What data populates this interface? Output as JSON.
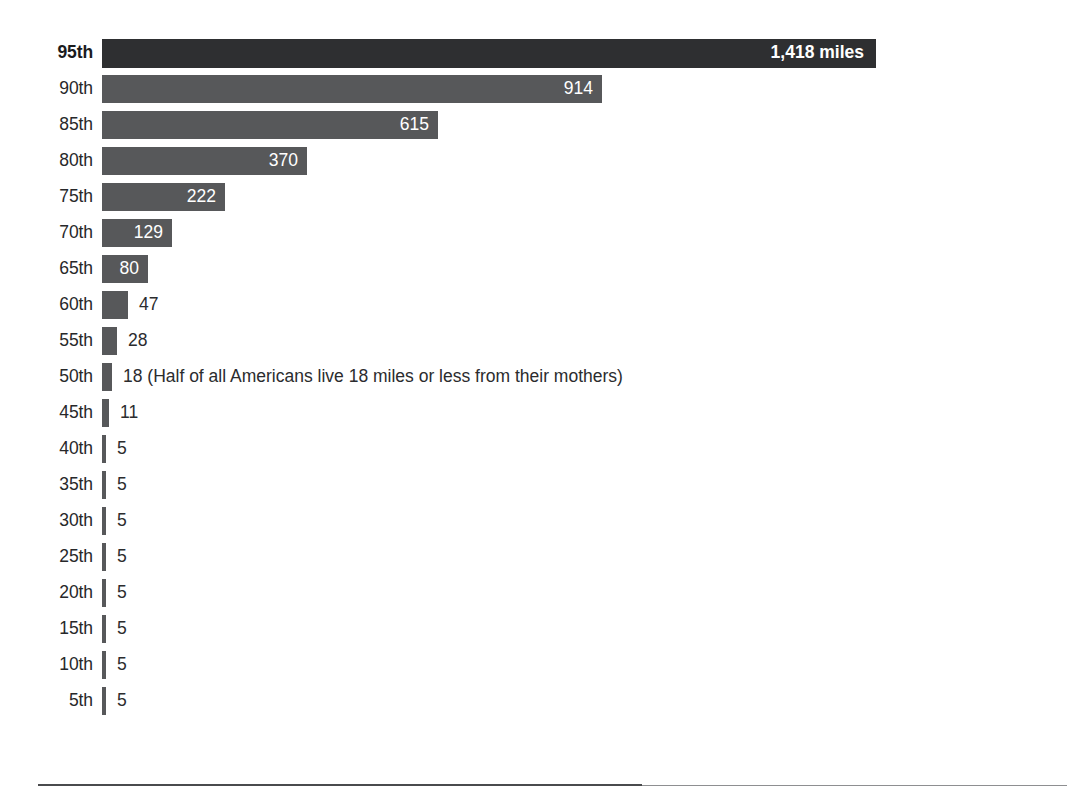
{
  "chart_data": {
    "type": "bar",
    "title": "",
    "subtitle": "",
    "xlabel": "",
    "ylabel": "",
    "orientation": "horizontal",
    "grid": false,
    "legend": null,
    "unit": "miles",
    "xlim": [
      0,
      1418
    ],
    "categories": [
      "95th",
      "90th",
      "85th",
      "80th",
      "75th",
      "70th",
      "65th",
      "60th",
      "55th",
      "50th",
      "45th",
      "40th",
      "35th",
      "30th",
      "25th",
      "20th",
      "15th",
      "10th",
      "5th"
    ],
    "values": [
      1418,
      914,
      615,
      370,
      222,
      129,
      80,
      47,
      28,
      18,
      11,
      5,
      5,
      5,
      5,
      5,
      5,
      5,
      5
    ],
    "annotations": [
      {
        "category": "50th",
        "text": "(Half of all Americans live 18 miles or less from their mothers)"
      }
    ],
    "bars": [
      {
        "label": "95th",
        "value": 1418,
        "value_text": "1,418 miles",
        "bar_px": 774,
        "label_inside": true,
        "highlight": true
      },
      {
        "label": "90th",
        "value": 914,
        "value_text": "914",
        "bar_px": 500,
        "label_inside": true,
        "highlight": false
      },
      {
        "label": "85th",
        "value": 615,
        "value_text": "615",
        "bar_px": 336,
        "label_inside": true,
        "highlight": false
      },
      {
        "label": "80th",
        "value": 370,
        "value_text": "370",
        "bar_px": 205,
        "label_inside": true,
        "highlight": false
      },
      {
        "label": "75th",
        "value": 222,
        "value_text": "222",
        "bar_px": 123,
        "label_inside": true,
        "highlight": false
      },
      {
        "label": "70th",
        "value": 129,
        "value_text": "129",
        "bar_px": 70,
        "label_inside": true,
        "highlight": false
      },
      {
        "label": "65th",
        "value": 80,
        "value_text": "80",
        "bar_px": 46,
        "label_inside": true,
        "highlight": false
      },
      {
        "label": "60th",
        "value": 47,
        "value_text": "47",
        "bar_px": 26,
        "label_inside": false,
        "highlight": false
      },
      {
        "label": "55th",
        "value": 28,
        "value_text": "28",
        "bar_px": 15,
        "label_inside": false,
        "highlight": false
      },
      {
        "label": "50th",
        "value": 18,
        "value_text": "18 (Half of all Americans live 18 miles or less from their mothers)",
        "bar_px": 10,
        "label_inside": false,
        "highlight": false
      },
      {
        "label": "45th",
        "value": 11,
        "value_text": "11",
        "bar_px": 7,
        "label_inside": false,
        "highlight": false
      },
      {
        "label": "40th",
        "value": 5,
        "value_text": "5",
        "bar_px": 4,
        "label_inside": false,
        "highlight": false
      },
      {
        "label": "35th",
        "value": 5,
        "value_text": "5",
        "bar_px": 4,
        "label_inside": false,
        "highlight": false
      },
      {
        "label": "30th",
        "value": 5,
        "value_text": "5",
        "bar_px": 4,
        "label_inside": false,
        "highlight": false
      },
      {
        "label": "25th",
        "value": 5,
        "value_text": "5",
        "bar_px": 4,
        "label_inside": false,
        "highlight": false
      },
      {
        "label": "20th",
        "value": 5,
        "value_text": "5",
        "bar_px": 4,
        "label_inside": false,
        "highlight": false
      },
      {
        "label": "15th",
        "value": 5,
        "value_text": "5",
        "bar_px": 4,
        "label_inside": false,
        "highlight": false
      },
      {
        "label": "10th",
        "value": 5,
        "value_text": "5",
        "bar_px": 4,
        "label_inside": false,
        "highlight": false
      },
      {
        "label": "5th",
        "value": 5,
        "value_text": "5",
        "bar_px": 4,
        "label_inside": false,
        "highlight": false
      }
    ]
  },
  "colors": {
    "bar_default": "#57585a",
    "bar_highlight": "#2e2f31",
    "label_text": "#27282a",
    "value_inside_text": "#ffffff",
    "value_outside_text": "#2b2c2e",
    "background": "#ffffff",
    "rule": "#4a4b4d"
  }
}
